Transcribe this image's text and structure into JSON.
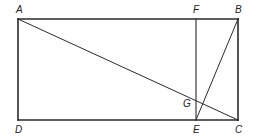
{
  "diagram": {
    "type": "geometry-figure",
    "stroke_color": "#2a2a2a",
    "background": "#ffffff",
    "points": {
      "A": {
        "label": "A",
        "x": 18,
        "y": 19
      },
      "B": {
        "label": "B",
        "x": 238,
        "y": 19
      },
      "C": {
        "label": "C",
        "x": 238,
        "y": 120
      },
      "D": {
        "label": "D",
        "x": 18,
        "y": 120
      },
      "E": {
        "label": "E",
        "x": 196,
        "y": 120
      },
      "F": {
        "label": "F",
        "x": 196,
        "y": 19
      },
      "G": {
        "label": "G",
        "x": 201,
        "y": 101
      }
    },
    "segments": [
      {
        "from": "A",
        "to": "B",
        "role": "rectangle-top"
      },
      {
        "from": "B",
        "to": "C",
        "role": "rectangle-right"
      },
      {
        "from": "C",
        "to": "D",
        "role": "rectangle-bottom"
      },
      {
        "from": "D",
        "to": "A",
        "role": "rectangle-left"
      },
      {
        "from": "F",
        "to": "E",
        "role": "vertical-segment"
      },
      {
        "from": "A",
        "to": "C",
        "role": "diagonal"
      },
      {
        "from": "E",
        "to": "B",
        "role": "slanted-segment"
      }
    ],
    "labels": {
      "A": "A",
      "B": "B",
      "C": "C",
      "D": "D",
      "E": "E",
      "F": "F",
      "G": "G"
    }
  }
}
